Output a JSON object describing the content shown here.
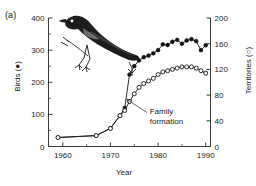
{
  "figure": {
    "panel_label": "(a)",
    "background": "#ffffff",
    "ink_color": "#161616"
  },
  "annotations": [
    {
      "name": "family-formation",
      "text_line1": "Family",
      "text_line2": "formation",
      "points_to_year": 1973
    }
  ],
  "illustration": {
    "name": "bird-illustration",
    "subject": "babbler perched on branch"
  },
  "chart_data": {
    "type": "line",
    "title": "",
    "subtitle": "",
    "xlabel": "Year",
    "ylabel": "Birds (●)",
    "y2label": "Territories (○)",
    "xlim": [
      1957,
      1991
    ],
    "ylim": [
      0,
      400
    ],
    "y2lim": [
      0,
      200
    ],
    "xticks": [
      1960,
      1970,
      1980,
      1990
    ],
    "xtick_labels": [
      "1960",
      "1970",
      "1980",
      "1990"
    ],
    "xminorticks": [
      1965,
      1975,
      1985
    ],
    "yticks": [
      0,
      100,
      200,
      300,
      400
    ],
    "ytick_labels": [
      "0",
      "100",
      "200",
      "300",
      "400"
    ],
    "yminorticks": [
      50,
      150,
      250,
      350
    ],
    "y2ticks": [
      0,
      40,
      80,
      120,
      160,
      200
    ],
    "y2tick_labels": [
      "0",
      "40",
      "80",
      "120",
      "160",
      "200"
    ],
    "grid": false,
    "legend_position": "in-axis-titles",
    "series": [
      {
        "name": "Birds (●)",
        "marker": "filled-circle",
        "axis": "left",
        "x": [
          1959,
          1967,
          1970,
          1972,
          1973,
          1974,
          1975,
          1976,
          1977,
          1978,
          1979,
          1980,
          1981,
          1982,
          1983,
          1984,
          1985,
          1986,
          1987,
          1988,
          1989,
          1990
        ],
        "values": [
          28,
          34,
          57,
          96,
          120,
          224,
          250,
          268,
          278,
          283,
          290,
          300,
          318,
          316,
          326,
          332,
          320,
          330,
          334,
          328,
          300,
          315
        ]
      },
      {
        "name": "Territories (○)",
        "marker": "open-circle",
        "axis": "right",
        "x": [
          1959,
          1967,
          1970,
          1972,
          1973,
          1974,
          1975,
          1976,
          1977,
          1978,
          1979,
          1980,
          1981,
          1982,
          1983,
          1984,
          1985,
          1986,
          1987,
          1988,
          1989,
          1990
        ],
        "values": [
          14,
          17,
          28,
          48,
          56,
          70,
          82,
          92,
          98,
          102,
          106,
          112,
          116,
          118,
          120,
          122,
          124,
          124,
          124,
          122,
          118,
          114
        ]
      }
    ]
  }
}
